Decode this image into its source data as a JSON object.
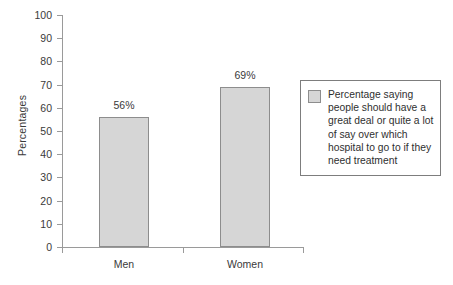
{
  "chart_data": {
    "type": "bar",
    "title": "",
    "xlabel": "",
    "ylabel": "Percentages",
    "categories": [
      "Men",
      "Women"
    ],
    "values": [
      56,
      69
    ],
    "value_labels": [
      "56%",
      "69%"
    ],
    "ylim": [
      0,
      100
    ],
    "y_ticks": [
      0,
      10,
      20,
      30,
      40,
      50,
      60,
      70,
      80,
      90,
      100
    ],
    "y_tick_labels": [
      "0",
      "10",
      "20",
      "30",
      "40",
      "50",
      "60",
      "70",
      "80",
      "90",
      "100"
    ],
    "grid": false,
    "legend_position": "right",
    "series": [
      {
        "name": "Percentage saying people should have a great deal or quite a lot of say over which hospital to go to if they need treatment",
        "values": [
          56,
          69
        ],
        "color": "#d6d6d6",
        "border_color": "#8d8d8d"
      }
    ]
  },
  "legend": {
    "label": "Percentage saying people should have a great deal or quite a lot of say over which hospital to go to if they need treatment",
    "swatch_color": "#d6d6d6"
  },
  "colors": {
    "bar_fill": "#d6d6d6",
    "bar_border": "#8d8d8d",
    "axis": "#9a9a9a",
    "text": "#3a3a3a",
    "background": "#ffffff"
  }
}
